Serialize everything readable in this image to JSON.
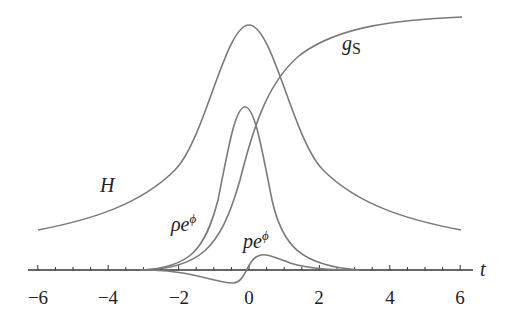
{
  "chart_data": {
    "type": "line",
    "title": "",
    "xlabel": "t",
    "ylabel": "",
    "xlim": [
      -6.3,
      6.3
    ],
    "x_ticks": [
      -6,
      -4,
      -2,
      0,
      2,
      4,
      6
    ],
    "x_tick_labels": [
      "−6",
      "−4",
      "−2",
      "0",
      "2",
      "4",
      "6"
    ],
    "grid": false,
    "legend": "inline labels",
    "series": [
      {
        "name": "H",
        "label_text": "H",
        "description": "symmetric bell-shaped, peak at t=0, slow decay",
        "x": [
          -6,
          -4,
          -3,
          -2,
          -1,
          -0.5,
          0,
          0.5,
          1,
          2,
          3,
          4,
          6
        ],
        "y": [
          0.17,
          0.3,
          0.4,
          0.56,
          0.82,
          0.95,
          1.0,
          0.95,
          0.82,
          0.56,
          0.4,
          0.3,
          0.17
        ]
      },
      {
        "name": "rho e^phi",
        "label_text": "ρe^φ",
        "description": "narrow peak near t≈-0.1",
        "x": [
          -3,
          -2,
          -1.5,
          -1,
          -0.5,
          -0.1,
          0.3,
          0.6,
          1,
          1.5,
          2,
          3
        ],
        "y": [
          0.0,
          0.04,
          0.12,
          0.3,
          0.55,
          0.66,
          0.55,
          0.35,
          0.15,
          0.05,
          0.02,
          0.0
        ]
      },
      {
        "name": "g_s",
        "label_text": "g_S",
        "description": "sigmoid rising from 0 to ~1",
        "x": [
          -6,
          -3,
          -2,
          -1,
          -0.5,
          0,
          0.5,
          1,
          2,
          3,
          4,
          6
        ],
        "y": [
          0.0,
          0.01,
          0.04,
          0.16,
          0.3,
          0.47,
          0.65,
          0.77,
          0.88,
          0.93,
          0.96,
          1.0
        ]
      },
      {
        "name": "p e^phi",
        "label_text": "pe^φ",
        "description": "antisymmetric-ish: dip below axis near t≈-0.3, bump above near t≈0.5",
        "x": [
          -3,
          -2,
          -1,
          -0.3,
          0,
          0.5,
          1,
          2,
          3
        ],
        "y": [
          0.0,
          -0.01,
          -0.04,
          -0.06,
          0.0,
          0.06,
          0.04,
          0.01,
          0.0
        ]
      }
    ]
  },
  "labels": {
    "H": "H",
    "rho": "ρe",
    "rho_sup": "ϕ",
    "p": "pe",
    "p_sup": "ϕ",
    "gs": "g",
    "gs_sub": "S",
    "t": "t"
  },
  "ticks": [
    "−6",
    "−4",
    "−2",
    "0",
    "2",
    "4",
    "6"
  ]
}
